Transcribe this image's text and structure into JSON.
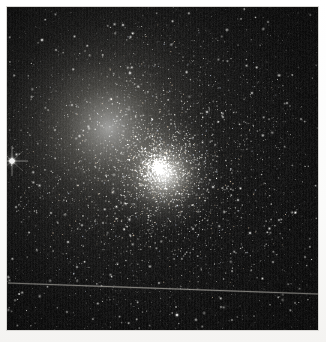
{
  "image": {
    "type": "astronomical-photograph",
    "subject": "globular star cluster",
    "caption": "",
    "width_px": 326,
    "height_px": 342,
    "border": {
      "color": "#fbfbfa",
      "left_px": 7,
      "top_px": 7,
      "right_px": 8,
      "bottom_px": 12
    },
    "plate": {
      "x": 7,
      "y": 7,
      "width": 311,
      "height": 323,
      "background_color": "#0b0b0c",
      "sky_color": "#101011"
    }
  },
  "cluster": {
    "core_center_x": 152,
    "core_center_y": 161,
    "core_radius_px": 26,
    "halo_radius_px": 150,
    "core_color": "#fffffc",
    "halo_color": "#d8d4c6",
    "star_count_rendered": 4200
  },
  "features": {
    "bright_star_left": {
      "x": 5,
      "y": 154,
      "magnitude_rel": 1.0,
      "has_diffraction_spikes": true
    },
    "streak": {
      "label": "satellite-trail",
      "x1": 1,
      "y1": 276,
      "x2": 311,
      "y2": 287,
      "color": "#8e8c84",
      "width_px": 1
    }
  },
  "notable_stars": [
    {
      "x": 5,
      "y": 154,
      "r": 3.4,
      "b": 1.0
    },
    {
      "x": 35,
      "y": 33,
      "r": 2.0,
      "b": 0.8
    },
    {
      "x": 116,
      "y": 18,
      "r": 1.8,
      "b": 0.72
    },
    {
      "x": 123,
      "y": 66,
      "r": 1.9,
      "b": 0.76
    },
    {
      "x": 49,
      "y": 43,
      "r": 1.5,
      "b": 0.62
    },
    {
      "x": 65,
      "y": 98,
      "r": 1.6,
      "b": 0.66
    },
    {
      "x": 48,
      "y": 123,
      "r": 1.5,
      "b": 0.6
    },
    {
      "x": 104,
      "y": 92,
      "r": 1.7,
      "b": 0.7
    },
    {
      "x": 200,
      "y": 105,
      "r": 1.8,
      "b": 0.74
    },
    {
      "x": 216,
      "y": 110,
      "r": 1.6,
      "b": 0.66
    },
    {
      "x": 245,
      "y": 86,
      "r": 1.7,
      "b": 0.7
    },
    {
      "x": 280,
      "y": 96,
      "r": 1.6,
      "b": 0.64
    },
    {
      "x": 294,
      "y": 112,
      "r": 1.5,
      "b": 0.6
    },
    {
      "x": 261,
      "y": 15,
      "r": 1.5,
      "b": 0.58
    },
    {
      "x": 9,
      "y": 200,
      "r": 1.6,
      "b": 0.64
    },
    {
      "x": 44,
      "y": 206,
      "r": 1.6,
      "b": 0.64
    },
    {
      "x": 61,
      "y": 235,
      "r": 1.7,
      "b": 0.7
    },
    {
      "x": 96,
      "y": 216,
      "r": 1.5,
      "b": 0.58
    },
    {
      "x": 206,
      "y": 180,
      "r": 1.8,
      "b": 0.74
    },
    {
      "x": 231,
      "y": 193,
      "r": 1.7,
      "b": 0.68
    },
    {
      "x": 186,
      "y": 222,
      "r": 1.6,
      "b": 0.64
    },
    {
      "x": 243,
      "y": 226,
      "r": 1.8,
      "b": 0.74
    },
    {
      "x": 272,
      "y": 213,
      "r": 1.6,
      "b": 0.62
    },
    {
      "x": 266,
      "y": 255,
      "r": 1.6,
      "b": 0.62
    },
    {
      "x": 70,
      "y": 260,
      "r": 1.6,
      "b": 0.62
    },
    {
      "x": 152,
      "y": 276,
      "r": 1.6,
      "b": 0.62
    },
    {
      "x": 170,
      "y": 308,
      "r": 2.1,
      "b": 0.84
    },
    {
      "x": 60,
      "y": 305,
      "r": 1.5,
      "b": 0.58
    },
    {
      "x": 214,
      "y": 300,
      "r": 1.5,
      "b": 0.58
    },
    {
      "x": 288,
      "y": 296,
      "r": 1.4,
      "b": 0.54
    },
    {
      "x": 298,
      "y": 250,
      "r": 1.5,
      "b": 0.58
    },
    {
      "x": 12,
      "y": 287,
      "r": 1.4,
      "b": 0.54
    }
  ],
  "accessibility": {
    "alt_text": "Dense globular star cluster with a brilliant unresolved core, thousands of resolved member stars fading into a dark sky, a bright foreground star at the left edge, and a faint diagonal satellite trail across the lower third."
  }
}
